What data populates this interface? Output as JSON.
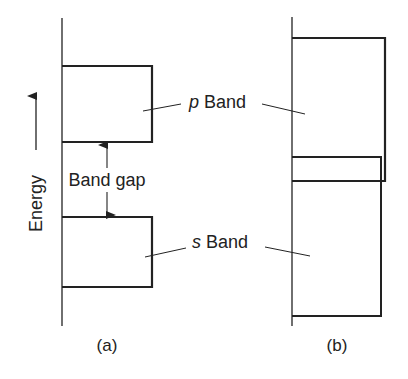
{
  "figure": {
    "axis_label": "Energy",
    "colors": {
      "line": "#222222",
      "background": "#ffffff"
    },
    "panel_a": {
      "caption": "(a)",
      "upper_band": {
        "letter": "p",
        "word": "Band"
      },
      "lower_band": {
        "letter": "s",
        "word": "Band"
      },
      "gap_label": "Band gap"
    },
    "panel_b": {
      "caption": "(b)",
      "description": "overlapping p and s bands"
    },
    "shared_labels": {
      "p_band": {
        "letter": "p",
        "word": " Band"
      },
      "s_band": {
        "letter": "s",
        "word": " Band"
      }
    }
  }
}
